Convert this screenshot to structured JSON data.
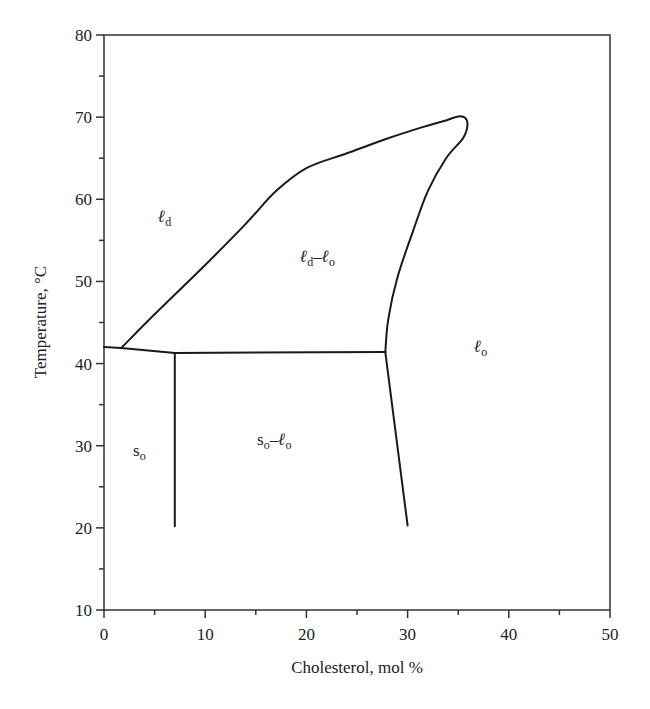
{
  "chart_data": {
    "type": "line",
    "title": "",
    "xlabel": "Cholesterol, mol %",
    "ylabel": "Temperature, °C",
    "xlim": [
      0,
      50
    ],
    "ylim": [
      10,
      80
    ],
    "grid": false,
    "x_ticks": [
      0,
      10,
      20,
      30,
      40,
      50
    ],
    "y_ticks": [
      10,
      20,
      30,
      40,
      50,
      60,
      70,
      80
    ],
    "x_minor_step": 5,
    "y_minor_step": 5,
    "series": [
      {
        "name": "ld / ld-lo boundary and dome",
        "points": [
          [
            1.7,
            41.9
          ],
          [
            5,
            46
          ],
          [
            10,
            52
          ],
          [
            14,
            57
          ],
          [
            17,
            61
          ],
          [
            20,
            63.8
          ],
          [
            24,
            65.6
          ],
          [
            28,
            67.4
          ],
          [
            31,
            68.6
          ],
          [
            33.5,
            69.5
          ],
          [
            35.2,
            70.1
          ],
          [
            35.9,
            69.4
          ],
          [
            35.5,
            67.5
          ],
          [
            33.8,
            65
          ],
          [
            32,
            61
          ],
          [
            30.5,
            56
          ],
          [
            29,
            50.5
          ],
          [
            28.1,
            45.5
          ],
          [
            27.8,
            41.4
          ]
        ]
      },
      {
        "name": "ld / so boundary",
        "points": [
          [
            0,
            42.0
          ],
          [
            1.7,
            41.9
          ],
          [
            7,
            41.3
          ]
        ]
      },
      {
        "name": "three-phase tie line",
        "points": [
          [
            7,
            41.3
          ],
          [
            27.8,
            41.4
          ]
        ]
      },
      {
        "name": "so / so-lo boundary",
        "points": [
          [
            7,
            41.3
          ],
          [
            7,
            20.2
          ]
        ]
      },
      {
        "name": "so-lo / lo boundary",
        "points": [
          [
            27.8,
            41.4
          ],
          [
            30.0,
            20.3
          ]
        ]
      }
    ],
    "annotations": [
      {
        "text": "ℓd",
        "x": 5.8,
        "y": 59.5,
        "label_id": "ld"
      },
      {
        "text": "ℓd–ℓo",
        "x": 22.5,
        "y": 51.5,
        "label_id": "ld-lo"
      },
      {
        "text": "ℓo",
        "x": 37.5,
        "y": 41,
        "label_id": "lo"
      },
      {
        "text": "so",
        "x": 3.5,
        "y": 30,
        "label_id": "so"
      },
      {
        "text": "so–ℓo",
        "x": 17,
        "y": 31.5,
        "label_id": "so-lo"
      }
    ]
  },
  "labels": {
    "xlabel": "Cholesterol, mol %",
    "ylabel": "Temperature, °C",
    "x_ticks": [
      "0",
      "10",
      "20",
      "30",
      "40",
      "50"
    ],
    "y_ticks": [
      "10",
      "20",
      "30",
      "40",
      "50",
      "60",
      "70",
      "80"
    ],
    "region_ld": {
      "main": "ℓ",
      "sub": "d"
    },
    "region_lo": {
      "main": "ℓ",
      "sub": "o"
    },
    "region_so": {
      "main": "s",
      "sub": "o"
    },
    "region_ld_lo": {
      "m1": "ℓ",
      "s1": "d",
      "dash": "–",
      "m2": "ℓ",
      "s2": "o"
    },
    "region_so_lo": {
      "m1": "s",
      "s1": "o",
      "dash": "–",
      "m2": "ℓ",
      "s2": "o"
    }
  }
}
